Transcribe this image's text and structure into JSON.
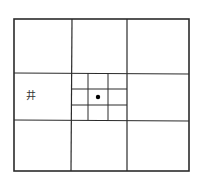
{
  "diagram": {
    "outer_frame": {
      "x": 14,
      "y": 19,
      "width": 175,
      "height": 152
    },
    "major_grid": {
      "vertical_x": [
        72,
        127
      ],
      "horizontal_y": [
        73,
        120
      ]
    },
    "center_subgrid": {
      "x_range": [
        72,
        127
      ],
      "y_range": [
        73,
        120
      ],
      "vertical_x": [
        88,
        108
      ],
      "horizontal_y": [
        89,
        105
      ]
    },
    "marker_dot": {
      "cx": 98,
      "cy": 97,
      "r": 2.2,
      "color": "#000000"
    },
    "labels": [
      {
        "text": "井",
        "cell": "middle-left",
        "x": 26,
        "y": 91
      }
    ],
    "line_color": "#2b2b2b"
  }
}
